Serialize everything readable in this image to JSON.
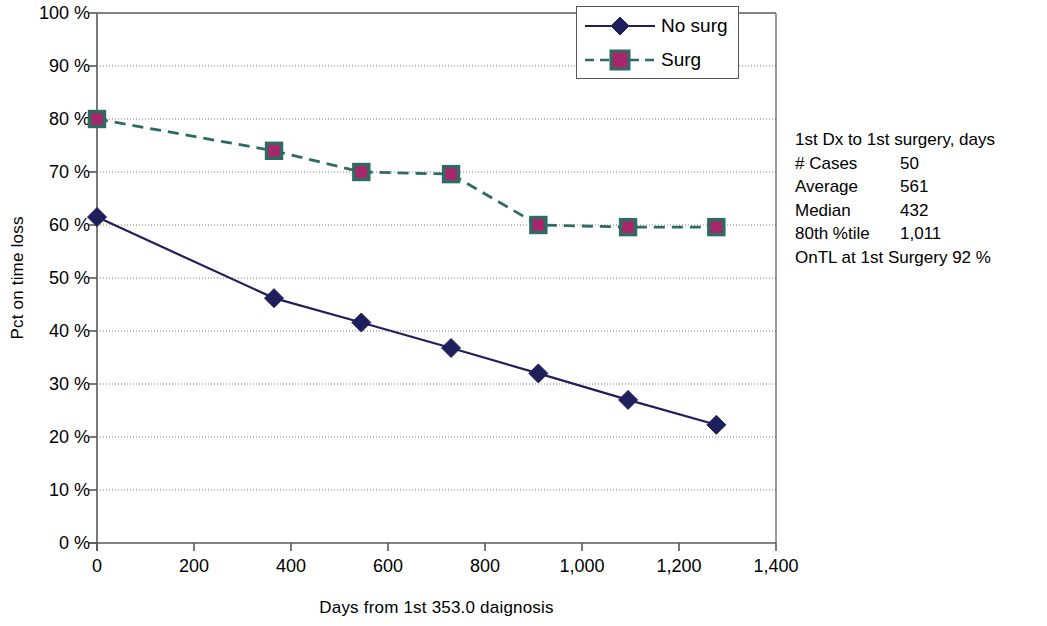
{
  "chart_data": {
    "type": "line",
    "title": "",
    "xlabel": "Days from 1st 353.0 daignosis",
    "ylabel": "Pct on time loss",
    "xlim": [
      0,
      1400
    ],
    "ylim": [
      0,
      100
    ],
    "xticks": [
      0,
      200,
      400,
      600,
      800,
      1000,
      1200,
      1400
    ],
    "xtick_labels": [
      "0",
      "200",
      "400",
      "600",
      "800",
      "1,000",
      "1,200",
      "1,400"
    ],
    "yticks": [
      0,
      10,
      20,
      30,
      40,
      50,
      60,
      70,
      80,
      90,
      100
    ],
    "ytick_labels": [
      "0 %",
      "10 %",
      "20 %",
      "30 %",
      "40 %",
      "50 %",
      "60 %",
      "70 %",
      "80 %",
      "90 %",
      "100 %"
    ],
    "grid": "horizontal-dotted",
    "legend_position": "top-right-inside",
    "series": [
      {
        "name": "No surg",
        "color": "#1f1f5c",
        "marker": "diamond",
        "line_style": "solid",
        "x": [
          0,
          365,
          545,
          730,
          910,
          1095,
          1277
        ],
        "values": [
          61.5,
          46.2,
          41.6,
          36.8,
          32.0,
          27.0,
          22.3
        ]
      },
      {
        "name": "Surg",
        "color": "#2d6b63",
        "marker_fill": "#a8266b",
        "marker_edge": "#2d6b63",
        "marker": "square",
        "line_style": "dashed",
        "x": [
          0,
          365,
          545,
          730,
          910,
          1095,
          1277
        ],
        "values": [
          80.0,
          74.0,
          70.0,
          69.6,
          60.0,
          59.6,
          59.6
        ]
      }
    ]
  },
  "legend": {
    "items": [
      {
        "label": "No surg"
      },
      {
        "label": "Surg"
      }
    ]
  },
  "stats": {
    "title": "1st Dx to 1st surgery, days",
    "rows": [
      {
        "label": "# Cases",
        "value": "50"
      },
      {
        "label": "Average",
        "value": "561"
      },
      {
        "label": "Median",
        "value": "432"
      },
      {
        "label": "80th %tile",
        "value": "1,011"
      }
    ],
    "footer": "OnTL at 1st Surgery 92 %"
  }
}
